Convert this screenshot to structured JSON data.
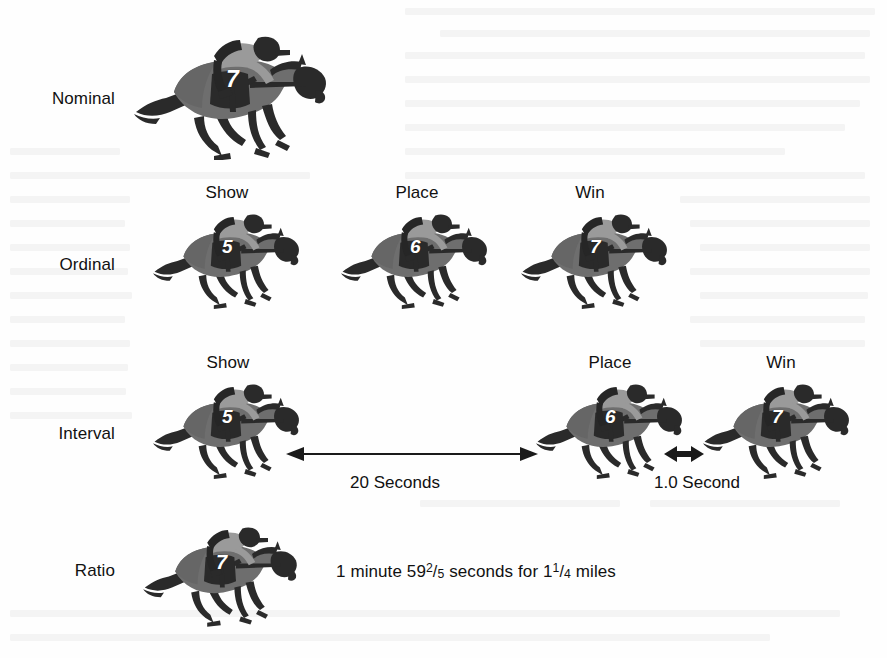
{
  "figure": {
    "width": 887,
    "height": 658,
    "background": "#fefefe",
    "ink_color": "#111111"
  },
  "palette": {
    "horse_body": "#6e6e6e",
    "horse_dark": "#2a2a2a",
    "jockey_silks": "#9a9a9a",
    "jockey_dark": "#262626",
    "number_text": "#ffffff",
    "arrow": "#1a1a1a"
  },
  "rows": [
    {
      "label": "Nominal",
      "label_y": 89,
      "headers": [],
      "horses": [
        {
          "number": "7",
          "x": 130,
          "y": 20,
          "w": 200,
          "h": 140,
          "num_x": 226,
          "num_y": 68
        }
      ],
      "annotations": []
    },
    {
      "label": "Ordinal",
      "label_y": 255,
      "headers": [
        {
          "text": "Show",
          "x": 227,
          "y": 183
        },
        {
          "text": "Place",
          "x": 417,
          "y": 183
        },
        {
          "text": "Win",
          "x": 590,
          "y": 183
        }
      ],
      "horses": [
        {
          "number": "5",
          "x": 150,
          "y": 196,
          "w": 152,
          "h": 118,
          "num_x": 222,
          "num_y": 237
        },
        {
          "number": "6",
          "x": 338,
          "y": 196,
          "w": 152,
          "h": 118,
          "num_x": 410,
          "num_y": 237
        },
        {
          "number": "7",
          "x": 518,
          "y": 196,
          "w": 152,
          "h": 118,
          "num_x": 590,
          "num_y": 237
        }
      ],
      "annotations": []
    },
    {
      "label": "Interval",
      "label_y": 424,
      "headers": [
        {
          "text": "Show",
          "x": 228,
          "y": 353
        },
        {
          "text": "Place",
          "x": 610,
          "y": 353
        },
        {
          "text": "Win",
          "x": 781,
          "y": 353
        }
      ],
      "horses": [
        {
          "number": "5",
          "x": 150,
          "y": 366,
          "w": 152,
          "h": 118,
          "num_x": 222,
          "num_y": 407
        },
        {
          "number": "6",
          "x": 533,
          "y": 366,
          "w": 152,
          "h": 118,
          "num_x": 605,
          "num_y": 407
        },
        {
          "number": "7",
          "x": 700,
          "y": 366,
          "w": 152,
          "h": 118,
          "num_x": 772,
          "num_y": 407
        }
      ],
      "annotations": [
        {
          "text": "20 Seconds",
          "x": 395,
          "y": 473
        },
        {
          "text": "1.0 Second",
          "x": 697,
          "y": 473
        }
      ],
      "arrows": [
        {
          "name": "twenty-seconds-arrow",
          "x": 286,
          "y": 453,
          "length": 250,
          "heads": "both-ends-single-line",
          "style": "long"
        },
        {
          "name": "one-second-arrow",
          "x": 666,
          "y": 453,
          "length": 36,
          "heads": "double",
          "style": "short"
        }
      ]
    },
    {
      "label": "Ratio",
      "label_y": 561,
      "headers": [],
      "horses": [
        {
          "number": "7",
          "x": 140,
          "y": 508,
          "w": 160,
          "h": 124,
          "num_x": 216,
          "num_y": 552
        }
      ],
      "annotations": []
    }
  ],
  "ratio_statement": {
    "x": 336,
    "y": 561,
    "parts": [
      {
        "type": "text",
        "value": "1 minute 59"
      },
      {
        "type": "fraction",
        "numerator": "2",
        "slash": "/",
        "denominator": "5"
      },
      {
        "type": "text",
        "value": " seconds for 1"
      },
      {
        "type": "fraction",
        "numerator": "1",
        "slash": "/",
        "denominator": "4"
      },
      {
        "type": "text",
        "value": " miles"
      }
    ],
    "plain": "1 minute 59 2/5 seconds for 1 1/4 miles"
  }
}
